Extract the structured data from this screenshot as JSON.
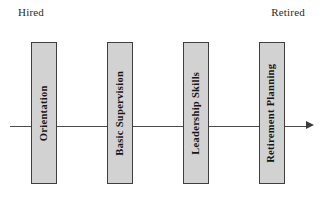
{
  "diagram": {
    "type": "timeline",
    "axis": {
      "orientation": "horizontal",
      "arrow_direction": "right",
      "start_label": "Hired",
      "end_label": "Retired"
    },
    "colors": {
      "box_fill": "#d2d2d2",
      "box_border": "#3f3f3f",
      "axis": "#4a4a4a",
      "text": "#161616",
      "background": "#ffffff"
    },
    "stages": [
      {
        "label": "Orientation"
      },
      {
        "label": "Basic Supervision"
      },
      {
        "label": "Leadership Skills"
      },
      {
        "label": "Retirement Planning"
      }
    ]
  }
}
